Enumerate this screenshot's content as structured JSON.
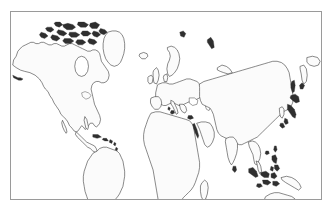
{
  "page": {
    "background_color": "#ffffff",
    "width": 333,
    "height": 212
  },
  "frame": {
    "name": "map-frame",
    "border_color": "#9a9a9a",
    "border_width_px": 1,
    "left": 10,
    "top": 11,
    "width": 312,
    "height": 189
  },
  "map": {
    "title": "",
    "type": "world-outline-map",
    "projection": "equirectangular",
    "ocean_color": "#ffffff",
    "land_fill_color": "#fbfbfb",
    "coastline_color": "#2b2b2b",
    "coastline_width_px": 0.55,
    "graticule_visible": false,
    "labels_visible": false,
    "antarctica_included": false,
    "lon_range": [
      -180,
      180
    ],
    "lat_range": [
      -58,
      84
    ],
    "regions": [
      {
        "id": "north-america",
        "label": "North America"
      },
      {
        "id": "greenland",
        "label": "Greenland"
      },
      {
        "id": "canadian-arctic",
        "label": "Canadian Arctic Archipelago"
      },
      {
        "id": "central-america",
        "label": "Central America"
      },
      {
        "id": "caribbean",
        "label": "Caribbean Islands"
      },
      {
        "id": "south-america",
        "label": "South America"
      },
      {
        "id": "europe",
        "label": "Europe"
      },
      {
        "id": "scandinavia",
        "label": "Scandinavia"
      },
      {
        "id": "british-isles",
        "label": "British Isles"
      },
      {
        "id": "iceland",
        "label": "Iceland"
      },
      {
        "id": "africa",
        "label": "Africa"
      },
      {
        "id": "madagascar",
        "label": "Madagascar"
      },
      {
        "id": "arabia",
        "label": "Arabian Peninsula"
      },
      {
        "id": "asia",
        "label": "Asia"
      },
      {
        "id": "india",
        "label": "Indian Subcontinent"
      },
      {
        "id": "southeast-asia",
        "label": "Southeast Asia"
      },
      {
        "id": "indonesia",
        "label": "Indonesian Archipelago"
      },
      {
        "id": "philippines",
        "label": "Philippines"
      },
      {
        "id": "japan",
        "label": "Japan"
      },
      {
        "id": "korea",
        "label": "Korean Peninsula"
      },
      {
        "id": "australia",
        "label": "Australia"
      },
      {
        "id": "new-guinea",
        "label": "New Guinea"
      },
      {
        "id": "new-zealand",
        "label": "New Zealand"
      },
      {
        "id": "sri-lanka",
        "label": "Sri Lanka"
      },
      {
        "id": "taiwan",
        "label": "Taiwan"
      },
      {
        "id": "sakhalin",
        "label": "Sakhalin"
      },
      {
        "id": "tasmania",
        "label": "Tasmania"
      }
    ]
  }
}
